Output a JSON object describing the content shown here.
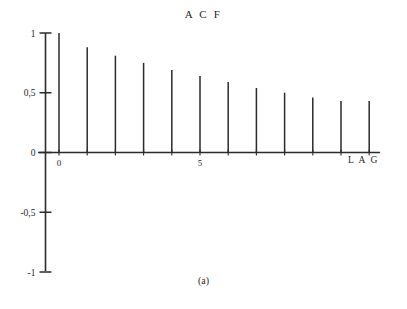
{
  "figure": {
    "caption": "(a)"
  },
  "chart_data": {
    "type": "bar",
    "title": "A C F",
    "subtitle": "",
    "xlabel": "L A G",
    "ylabel": "",
    "categories": [
      0,
      1,
      2,
      3,
      4,
      5,
      6,
      7,
      8,
      9,
      10,
      11
    ],
    "values": [
      1.0,
      0.88,
      0.81,
      0.75,
      0.69,
      0.64,
      0.59,
      0.54,
      0.5,
      0.46,
      0.43,
      0.43
    ],
    "series": [
      {
        "name": "ACF",
        "values": [
          1.0,
          0.88,
          0.81,
          0.75,
          0.69,
          0.64,
          0.59,
          0.54,
          0.5,
          0.46,
          0.43,
          0.43
        ]
      }
    ],
    "xlim": [
      -0.6,
      11.8
    ],
    "ylim": [
      -1,
      1
    ],
    "x_tick_values": [
      0,
      5
    ],
    "x_tick_labels": [
      "0",
      "5"
    ],
    "y_tick_values": [
      1,
      0.5,
      0,
      -0.5,
      -1
    ],
    "y_tick_labels": [
      "1",
      "0,5",
      "0",
      "-0,5",
      "-1"
    ],
    "grid": false,
    "legend": null,
    "legend_position": "none",
    "annotations": [],
    "line_color": "#2b2b2b",
    "axis_color": "#2b2b2b",
    "background_color": "#ffffff"
  },
  "axis_labels": {
    "y_1": "1",
    "y_05": "0,5",
    "y_0": "0",
    "y_neg05": "-0,5",
    "y_neg1": "-1",
    "x_0": "0",
    "x_5": "5",
    "x_lag": "L A G"
  }
}
